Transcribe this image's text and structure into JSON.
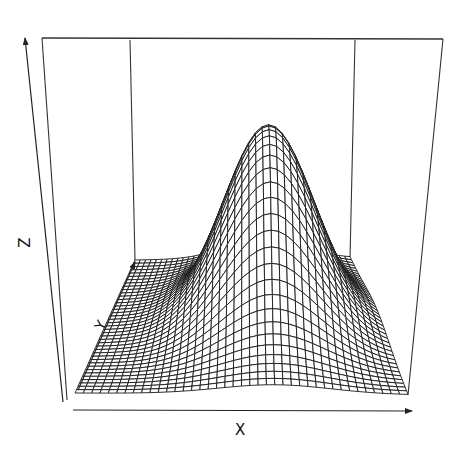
{
  "chart_data": {
    "type": "surface",
    "title": "",
    "xlabel": "X",
    "ylabel": "Y",
    "zlabel": "Z",
    "ticks": "none",
    "box": true,
    "grid": false,
    "legend": null,
    "projection": {
      "theta": 0,
      "phi": 15,
      "style": "perspective wireframe mesh"
    },
    "surface": {
      "function": "bivariate gaussian bump",
      "nx": 40,
      "ny": 40,
      "x_range": [
        0,
        1
      ],
      "y_range": [
        0,
        1
      ],
      "z_range": [
        0,
        1
      ],
      "peak": {
        "x": 0.6,
        "y": 0.55,
        "z": 1.0
      },
      "sigma_x": 0.17,
      "sigma_y": 0.22,
      "baseline_z": 0.0
    }
  },
  "colors": {
    "background": "#ffffff",
    "mesh_line": "#1a1a1a",
    "mesh_fill": "#ffffff",
    "box_line": "#333333",
    "axis_line": "#222222"
  },
  "geometry": {
    "front_left": [
      75,
      393
    ],
    "front_right": [
      408,
      395
    ],
    "back_left": [
      135,
      260
    ],
    "back_right": [
      350,
      258
    ],
    "box_top_left": [
      42,
      38
    ],
    "box_top_right": [
      443,
      39
    ],
    "box_back_top_left": [
      130,
      40
    ],
    "box_back_top_right": [
      355,
      40
    ],
    "peak_pixel_height": 215
  },
  "axes": {
    "x": {
      "label": "X",
      "arrow_from": [
        73,
        410
      ],
      "arrow_to": [
        412,
        411
      ]
    },
    "z": {
      "label": "Z",
      "arrow_from": [
        63,
        402
      ],
      "arrow_to": [
        25,
        38
      ]
    },
    "y": {
      "label": "Y",
      "arrow_from": [
        78,
        390
      ],
      "arrow_to": [
        135,
        262
      ]
    }
  }
}
